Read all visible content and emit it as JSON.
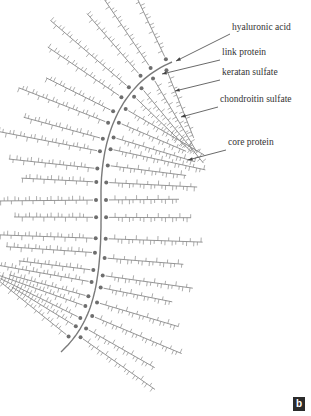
{
  "figure": {
    "panel_label": "b",
    "labels": [
      {
        "id": "hyaluronic_acid",
        "text": "hyaluronic acid",
        "x": 232,
        "y": 28,
        "arrow_from": [
          230,
          34
        ],
        "arrow_to": [
          176,
          61
        ]
      },
      {
        "id": "link_protein",
        "text": "link protein",
        "x": 222,
        "y": 53,
        "arrow_from": [
          220,
          60
        ],
        "arrow_to": [
          162,
          74
        ]
      },
      {
        "id": "keratan_sulfate",
        "text": "keratan sulfate",
        "x": 222,
        "y": 73,
        "arrow_from": [
          220,
          80
        ],
        "arrow_to": [
          175,
          91
        ]
      },
      {
        "id": "chondroitin_sulfate",
        "text": "chondroitin sulfate",
        "x": 220,
        "y": 100,
        "arrow_from": [
          218,
          107
        ],
        "arrow_to": [
          181,
          117
        ]
      },
      {
        "id": "core_protein",
        "text": "core protein",
        "x": 228,
        "y": 143,
        "arrow_from": [
          226,
          150
        ],
        "arrow_to": [
          188,
          160
        ]
      }
    ],
    "colors": {
      "strand": "#8a8a8a",
      "backbone": "#7a7a7a",
      "dot": "#6e6e6e",
      "text": "#333333",
      "arrow": "#444444"
    }
  }
}
